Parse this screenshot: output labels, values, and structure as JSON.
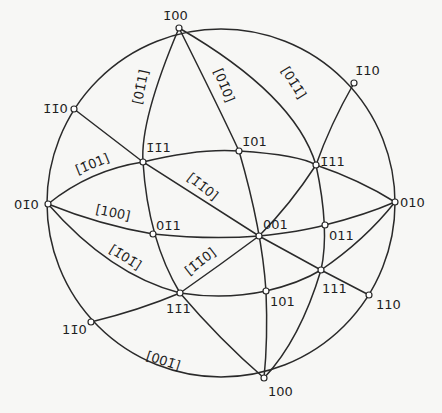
{
  "diagram": {
    "type": "stereographic-projection",
    "primitive_circle": {
      "cx": 221,
      "cy": 203,
      "r": 174
    },
    "poles": [
      {
        "id": "m100",
        "label": "1̄00",
        "x": 179,
        "y": 28,
        "lx": 163,
        "ly": 20
      },
      {
        "id": "m110",
        "label": "1̄10",
        "x": 354,
        "y": 83,
        "lx": 355,
        "ly": 75
      },
      {
        "id": "mm10",
        "label": "1̄1̄0",
        "x": 74,
        "y": 109,
        "lx": 43,
        "ly": 113
      },
      {
        "id": "mm11",
        "label": "1̄1̄1",
        "x": 143,
        "y": 162,
        "lx": 146,
        "ly": 152
      },
      {
        "id": "m101",
        "label": "1̄01",
        "x": 239,
        "y": 151,
        "lx": 242,
        "ly": 146
      },
      {
        "id": "m111",
        "label": "1̄11",
        "x": 316,
        "y": 165,
        "lx": 320,
        "ly": 166
      },
      {
        "id": "0m10",
        "label": "01̄0",
        "x": 48,
        "y": 204,
        "lx": 14,
        "ly": 209
      },
      {
        "id": "010",
        "label": "010",
        "x": 395,
        "y": 202,
        "lx": 400,
        "ly": 207
      },
      {
        "id": "0m11",
        "label": "01̄1",
        "x": 153,
        "y": 234,
        "lx": 156,
        "ly": 230
      },
      {
        "id": "001",
        "label": "001",
        "x": 259,
        "y": 236,
        "lx": 263,
        "ly": 229
      },
      {
        "id": "011",
        "label": "011",
        "x": 325,
        "y": 225,
        "lx": 329,
        "ly": 240
      },
      {
        "id": "1m11",
        "label": "11̄1",
        "x": 180,
        "y": 293,
        "lx": 166,
        "ly": 313
      },
      {
        "id": "101",
        "label": "101",
        "x": 266,
        "y": 291,
        "lx": 270,
        "ly": 306
      },
      {
        "id": "111",
        "label": "111",
        "x": 321,
        "y": 270,
        "lx": 322,
        "ly": 293
      },
      {
        "id": "110",
        "label": "110",
        "x": 369,
        "y": 295,
        "lx": 376,
        "ly": 309
      },
      {
        "id": "1m10",
        "label": "11̄0",
        "x": 91,
        "y": 322,
        "lx": 62,
        "ly": 334
      },
      {
        "id": "100",
        "label": "100",
        "x": 264,
        "y": 378,
        "lx": 268,
        "ly": 396
      }
    ],
    "zone_labels": [
      {
        "text": "[01̄1]",
        "x": 145,
        "y": 88,
        "rot": -78
      },
      {
        "text": "[01̄0]",
        "x": 220,
        "y": 87,
        "rot": 68
      },
      {
        "text": "[01̄1̄]",
        "x": 290,
        "y": 85,
        "rot": 58
      },
      {
        "text": "[1̄01]",
        "x": 94,
        "y": 168,
        "rot": -22
      },
      {
        "text": "[1̄1̄0]",
        "x": 200,
        "y": 190,
        "rot": 38
      },
      {
        "text": "[100]",
        "x": 112,
        "y": 217,
        "rot": 12
      },
      {
        "text": "[1̄01̄]",
        "x": 123,
        "y": 261,
        "rot": 32
      },
      {
        "text": "[1̄1̄0]",
        "x": 203,
        "y": 265,
        "rot": -38
      },
      {
        "text": "[001̄]",
        "x": 162,
        "y": 365,
        "rot": 18
      }
    ],
    "great_circles": [
      {
        "name": "zone-01m1",
        "from": "m100",
        "via": "mm11",
        "to": "1m11",
        "path": "M179,28 Q140,120 143,162 Q148,240 180,293"
      },
      {
        "name": "zone-01m1-cont",
        "from": "1m11",
        "to": "100",
        "path": "M180,293 Q220,340 264,378"
      },
      {
        "name": "zone-010",
        "from": "m100",
        "via": "m101",
        "to": "100",
        "path": "M179,28 Q220,110 239,151 Q262,230 266,291 Q268,340 264,378"
      },
      {
        "name": "zone-01m1m",
        "from": "m100",
        "via": "m111",
        "to": "100",
        "path": "M179,28 Q295,95 316,165 Q330,230 321,270 Q300,340 264,378"
      },
      {
        "name": "zone-equator-top",
        "from": "0m10",
        "via": "m101",
        "to": "010",
        "path": "M48,204 Q90,170 143,162 Q200,148 239,151 Q300,155 316,165 Q360,180 395,202"
      },
      {
        "name": "zone-equator-mid",
        "from": "0m10",
        "via": "001",
        "to": "010",
        "path": "M48,204 Q100,225 153,234 Q210,240 259,236 Q300,232 325,225 Q365,215 395,202"
      },
      {
        "name": "zone-equator-bot",
        "from": "0m10",
        "via": "101",
        "to": "010",
        "path": "M48,204 Q110,275 180,293 Q225,300 266,291 Q300,283 321,270 Q365,240 395,202"
      },
      {
        "name": "zone-mm10-110",
        "from": "mm10",
        "via": "001",
        "to": "110",
        "path": "M74,109 L143,162 L259,236 L321,270 L369,295"
      },
      {
        "name": "zone-m110-1m10",
        "from": "m110",
        "via": "001",
        "to": "1m10",
        "path": "M354,83 Q330,125 316,165 Q290,205 259,236 Q220,265 180,293 Q140,310 91,322"
      }
    ]
  }
}
